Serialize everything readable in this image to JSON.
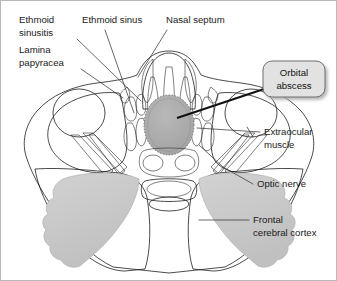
{
  "figure": {
    "type": "anatomical-diagram",
    "view": "axial",
    "border_color": "#b9b9b9",
    "background_color": "#ffffff"
  },
  "palette": {
    "background": "#ffffff",
    "soft_tissue_light": "#ebebeb",
    "soft_tissue_mid": "#d6d6d6",
    "bone_outline": "#1e1e1e",
    "muscle_gray": "#a6a6a6",
    "globe_gray": "#9a9a9a",
    "abscess_gray": "#ababab",
    "brain_gray": "#c9c9c9",
    "mucosa_gray": "#b0b0b0",
    "callout_fill": "#e2e2e2",
    "callout_border": "#6e6e6e",
    "callout_shadow": "#bdbdbd",
    "label_text": "#1a1a1a",
    "leader_line": "#2a2a2a"
  },
  "labels": [
    {
      "id": "ethmoid-sinusitis",
      "lines": [
        "Ethmoid",
        "sinusitis"
      ],
      "side": "left",
      "x": 18,
      "y": 22,
      "leader": "M 76 38 L 140 100",
      "points_to": "ethmoid air cells, opacified"
    },
    {
      "id": "lamina-papyracea",
      "lines": [
        "Lamina",
        "papyracea"
      ],
      "side": "left",
      "x": 18,
      "y": 52,
      "leader": "M 78 68 L 120 96",
      "points_to": "medial orbital wall"
    },
    {
      "id": "ethmoid-sinus",
      "lines": [
        "Ethmoid sinus"
      ],
      "side": "top",
      "x": 81,
      "y": 22,
      "leader": "M 104 28 L 133 112",
      "points_to": "ethmoid air cell"
    },
    {
      "id": "nasal-septum",
      "lines": [
        "Nasal septum"
      ],
      "side": "top",
      "x": 165,
      "y": 22,
      "leader": "M 165 28 L 136 75",
      "points_to": "midline bony/cartilaginous septum"
    },
    {
      "id": "extraocular-muscle",
      "lines": [
        "Extraocular",
        "muscle"
      ],
      "side": "right",
      "x": 262,
      "y": 134,
      "leader": "M 258 131 L 196 127",
      "points_to": "medial rectus muscle"
    },
    {
      "id": "optic-nerve",
      "lines": [
        "Optic nerve"
      ],
      "side": "right",
      "x": 256,
      "y": 186,
      "leader": "M 252 183 L 196 142",
      "points_to": "optic nerve within orbital apex"
    },
    {
      "id": "frontal-cerebral-cortex",
      "lines": [
        "Frontal",
        "cerebral cortex"
      ],
      "side": "right",
      "x": 252,
      "y": 222,
      "leader": "M 248 219 L 198 219",
      "points_to": "frontal lobe gray matter"
    }
  ],
  "callout": {
    "id": "orbital-abscess",
    "lines": [
      "Orbital",
      "abscess"
    ],
    "box": {
      "x": 262,
      "y": 60,
      "width": 62,
      "height": 36,
      "radius": 9
    },
    "leader": "M 262 86 L 176 117",
    "points_to": "subperiosteal / intraorbital abscess collection"
  },
  "structures": [
    {
      "id": "skull-soft-tissue",
      "name": "Facial soft tissue envelope",
      "fill": "#ebebeb"
    },
    {
      "id": "right-globe",
      "name": "Right globe",
      "fill": "#9a9a9a"
    },
    {
      "id": "left-globe",
      "name": "Left globe",
      "fill": "#9a9a9a"
    },
    {
      "id": "abscess-mass",
      "name": "Orbital abscess",
      "fill": "#ababab",
      "texture": "stippled-margin"
    },
    {
      "id": "ethmoid-air-cells",
      "name": "Ethmoid air cells",
      "fill": "#b0b0b0"
    },
    {
      "id": "nasal-septum-body",
      "name": "Nasal septum",
      "fill": "#b0b0b0"
    },
    {
      "id": "sphenoid-sinus",
      "name": "Sphenoid sinus",
      "fill": "#ffffff"
    },
    {
      "id": "frontal-lobe-right",
      "name": "Frontal cerebral cortex (right)",
      "fill": "#c9c9c9"
    },
    {
      "id": "frontal-lobe-left",
      "name": "Frontal cerebral cortex (left)",
      "fill": "#c9c9c9"
    },
    {
      "id": "optic-nerves",
      "name": "Optic nerves",
      "fill": "#a6a6a6"
    },
    {
      "id": "extraocular-muscles",
      "name": "Extraocular muscles",
      "fill": "#a6a6a6"
    }
  ]
}
